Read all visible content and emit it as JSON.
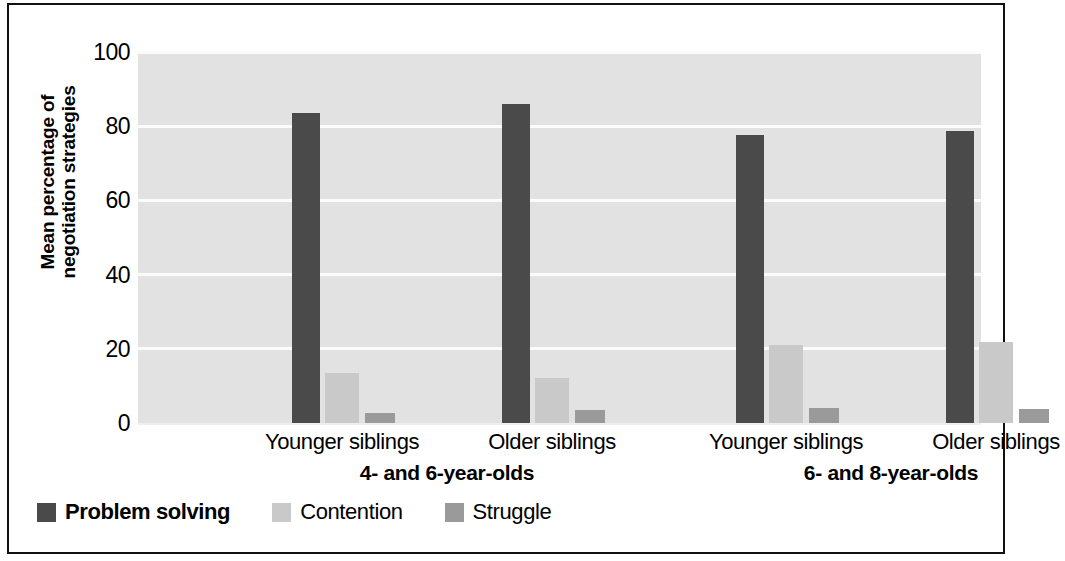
{
  "chart_data": {
    "type": "bar",
    "title": "",
    "xlabel": "",
    "ylabel_line1": "Mean percentage of",
    "ylabel_line2": "negotiation strategies",
    "ylim": [
      0,
      100
    ],
    "yticks": [
      100,
      80,
      60,
      40,
      20,
      0
    ],
    "grid": true,
    "legend_position": "bottom-left",
    "group_labels": [
      "4- and 6-year-olds",
      "6- and 8-year-olds"
    ],
    "categories": [
      "Younger siblings",
      "Older siblings",
      "Younger siblings",
      "Older siblings"
    ],
    "category_groups": [
      0,
      0,
      1,
      1
    ],
    "series": [
      {
        "name": "Problem solving",
        "color": "#4a4a4a",
        "values": [
          83.5,
          86.0,
          77.5,
          78.8
        ]
      },
      {
        "name": "Contention",
        "color": "#c9c9c9",
        "values": [
          13.5,
          12.0,
          21.0,
          21.8
        ]
      },
      {
        "name": "Struggle",
        "color": "#9a9a9a",
        "values": [
          2.8,
          3.5,
          4.0,
          3.9
        ]
      }
    ],
    "plot_background": "#e2e2e2",
    "gridline_color": "#fbfbfb",
    "frame_color": "#111111"
  }
}
